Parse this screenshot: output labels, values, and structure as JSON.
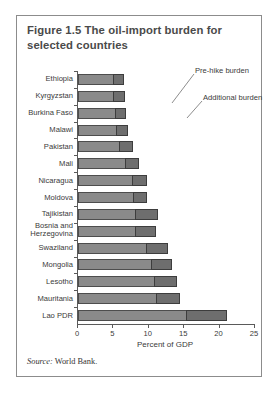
{
  "figure": {
    "title": "Figure 1.5  The oil-import burden for selected countries",
    "source_prefix": "Source:",
    "source_text": "World Bank."
  },
  "annotations": {
    "pre_hike": "Pre-hike burden",
    "additional": "Additional burden"
  },
  "colors": {
    "pre_hike_fill": "#8a8a8a",
    "additional_fill": "#6e6e6e",
    "border": "#8c8c8c",
    "axis": "#5a5a5a",
    "title_text": "#4a4a4a"
  },
  "chart_data": {
    "type": "bar",
    "orientation": "horizontal",
    "stacked": true,
    "title": "Figure 1.5  The oil-import burden for selected countries",
    "xlabel": "Percent of GDP",
    "ylabel": "",
    "xlim": [
      0,
      25
    ],
    "xticks": [
      0,
      5,
      10,
      15,
      20,
      25
    ],
    "grid": false,
    "legend": "annotated-inline",
    "categories": [
      "Ethiopia",
      "Kyrgyzstan",
      "Burkina Faso",
      "Malawi",
      "Pakistan",
      "Mali",
      "Nicaragua",
      "Moldova",
      "Tajikistan",
      "Bosnia and Herzegovina",
      "Swaziland",
      "Mongolia",
      "Lesotho",
      "Mauritania",
      "Lao PDR"
    ],
    "series": [
      {
        "name": "Pre-hike burden",
        "values": [
          5.0,
          5.0,
          5.2,
          5.3,
          5.8,
          6.7,
          7.6,
          7.7,
          8.0,
          8.0,
          9.6,
          10.3,
          10.8,
          11.0,
          15.2
        ]
      },
      {
        "name": "Additional burden",
        "values": [
          1.5,
          1.6,
          1.6,
          1.7,
          1.9,
          1.9,
          2.2,
          2.1,
          3.3,
          3.0,
          3.1,
          3.0,
          3.2,
          3.4,
          5.9
        ]
      }
    ],
    "totals": [
      6.5,
      6.6,
      6.8,
      7.0,
      7.7,
      8.6,
      9.8,
      9.8,
      11.3,
      11.0,
      12.7,
      13.3,
      14.0,
      14.4,
      21.1
    ]
  }
}
